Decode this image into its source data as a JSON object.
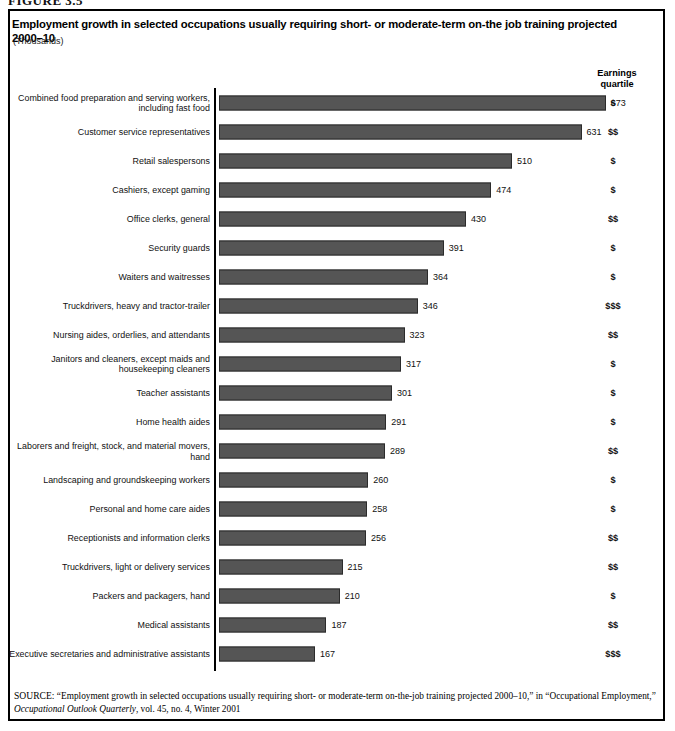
{
  "figure": {
    "caption_clipped": "FIGURE 3.5",
    "title": "Employment growth in selected occupations usually requiring short- or moderate-term on-the job training projected 2000–10",
    "units": "(Thousands)",
    "earnings_header_line1": "Earnings",
    "earnings_header_line2": "quartile"
  },
  "source": {
    "label": "SOURCE:",
    "text_part1": "“Employment growth in selected occupations usually requiring short- or moderate-term on-the-job training projected 2000–10,” in “Occupational Employment,” ",
    "italic_title": "Occupational Outlook Quarterly",
    "text_part2": ", vol. 45, no. 4, Winter 2001"
  },
  "chart_data": {
    "type": "bar",
    "orientation": "horizontal",
    "title": "Employment growth in selected occupations usually requiring short- or moderate-term on-the job training projected 2000–10",
    "xlabel": "Thousands",
    "ylabel": "",
    "xlim": [
      0,
      700
    ],
    "grid": false,
    "legend": "none",
    "bar_color": "#555555",
    "categories": [
      "Combined food preparation and serving workers,\nincluding fast food",
      "Customer service representatives",
      "Retail salespersons",
      "Cashiers, except gaming",
      "Office clerks, general",
      "Security guards",
      "Waiters and waitresses",
      "Truckdrivers, heavy and tractor-trailer",
      "Nursing aides, orderlies, and attendants",
      "Janitors and cleaners, except maids and\nhousekeeping cleaners",
      "Teacher assistants",
      "Home health aides",
      "Laborers and freight, stock, and material movers, hand",
      "Landscaping and groundskeeping workers",
      "Personal and home care aides",
      "Receptionists and information clerks",
      "Truckdrivers, light or delivery services",
      "Packers and packagers, hand",
      "Medical assistants",
      "Executive secretaries and administrative assistants"
    ],
    "values": [
      673,
      631,
      510,
      474,
      430,
      391,
      364,
      346,
      323,
      317,
      301,
      291,
      289,
      260,
      258,
      256,
      215,
      210,
      187,
      167
    ],
    "earnings_quartile": [
      "$",
      "$$",
      "$",
      "$",
      "$$",
      "$",
      "$",
      "$$$",
      "$$",
      "$",
      "$",
      "$",
      "$$",
      "$",
      "$",
      "$$",
      "$$",
      "$",
      "$$",
      "$$$"
    ]
  }
}
